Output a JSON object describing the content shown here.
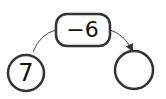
{
  "diagram": {
    "type": "operation-arrow",
    "input": {
      "value": "7"
    },
    "operation": {
      "label": "−6"
    },
    "output": {
      "value": ""
    },
    "colors": {
      "stroke": "#333333",
      "text": "#111111",
      "background": "#ffffff"
    }
  }
}
